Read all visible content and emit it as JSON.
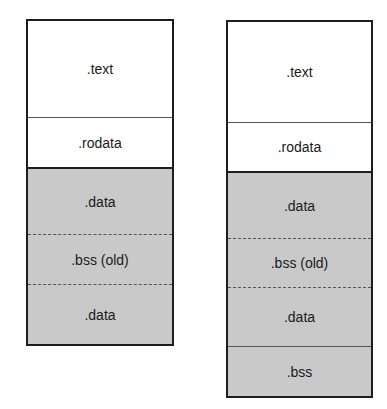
{
  "diagram": {
    "left": {
      "segments": [
        {
          "label": ".text",
          "fill": "white"
        },
        {
          "label": ".rodata",
          "fill": "white"
        },
        {
          "label": ".data",
          "fill": "gray"
        },
        {
          "label": ".bss (old)",
          "fill": "gray"
        },
        {
          "label": ".data",
          "fill": "gray"
        }
      ]
    },
    "right": {
      "segments": [
        {
          "label": ".text",
          "fill": "white"
        },
        {
          "label": ".rodata",
          "fill": "white"
        },
        {
          "label": ".data",
          "fill": "gray"
        },
        {
          "label": ".bss (old)",
          "fill": "gray"
        },
        {
          "label": ".data",
          "fill": "gray"
        },
        {
          "label": ".bss",
          "fill": "gray"
        }
      ]
    },
    "colors": {
      "border": "#1e1e1e",
      "gray_fill": "#c9c9c9",
      "white_fill": "#ffffff"
    }
  }
}
